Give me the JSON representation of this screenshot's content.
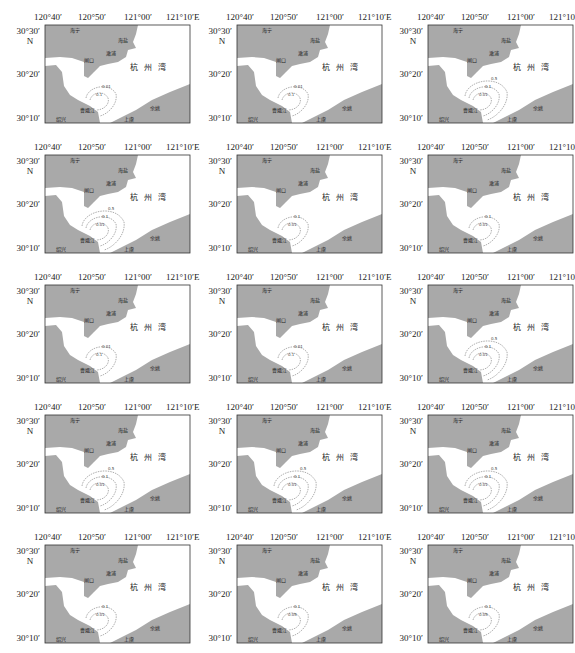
{
  "figure": {
    "rows": 5,
    "cols": 3,
    "axes": {
      "x_ticks": [
        "120°40′",
        "120°50′",
        "121°00′",
        "121°10′"
      ],
      "x_unit": "E",
      "y_ticks": [
        "30°30′",
        "30°20′",
        "30°10′"
      ],
      "y_unit": "N"
    },
    "places": {
      "haining": "海宁",
      "haiyan": "海盐",
      "ganpu": "澉浦",
      "zhakou": "闸口",
      "bay": "杭州湾",
      "caoejiang": "曹娥江",
      "shaoxing": "绍兴",
      "shangyu": "上虞",
      "yuyao": "余姚"
    },
    "colors": {
      "land": "#a9a9a9",
      "water": "#ffffff",
      "contour": "#777777",
      "frame": "#333333"
    },
    "panels": [
      {
        "id": "r1c1",
        "contours": [
          "0.1",
          "0.01"
        ]
      },
      {
        "id": "r1c2",
        "contours": [
          "0.1",
          "0.01"
        ]
      },
      {
        "id": "r1c3",
        "contours": [
          "0.01",
          "0.1",
          "0.5"
        ]
      },
      {
        "id": "r2c1",
        "contours": [
          "0.01",
          "0.1",
          "0.5"
        ]
      },
      {
        "id": "r2c2",
        "contours": [
          "0.01",
          "0.1"
        ]
      },
      {
        "id": "r2c3",
        "contours": [
          "0.01",
          "0.1"
        ]
      },
      {
        "id": "r3c1",
        "contours": [
          "0.1",
          "0.01"
        ]
      },
      {
        "id": "r3c2",
        "contours": [
          "0.1",
          "0.01"
        ]
      },
      {
        "id": "r3c3",
        "contours": [
          "0.01",
          "0.1",
          "0.5"
        ]
      },
      {
        "id": "r4c1",
        "contours": [
          "0.01",
          "0.1",
          "0.5"
        ]
      },
      {
        "id": "r4c2",
        "contours": [
          "0.01",
          "0.1",
          "0.5"
        ]
      },
      {
        "id": "r4c3",
        "contours": [
          "0.01",
          "0.1",
          "0.5"
        ]
      },
      {
        "id": "r5c1",
        "contours": [
          "0.01",
          "0.1"
        ]
      },
      {
        "id": "r5c2",
        "contours": [
          "0.05",
          "0.1"
        ]
      },
      {
        "id": "r5c3",
        "contours": [
          "0.05",
          "0.1"
        ]
      }
    ]
  }
}
